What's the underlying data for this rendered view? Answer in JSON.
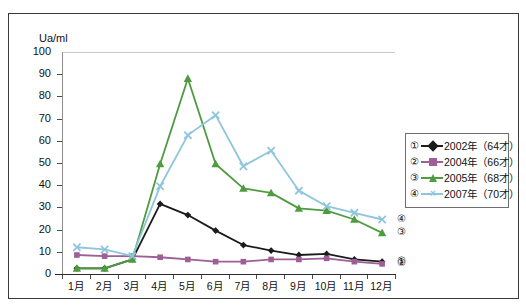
{
  "top_caption_ghost": "     ",
  "figure": {
    "y_axis_title": "Ua/ml"
  },
  "legend": {
    "rows": [
      {
        "index": "①",
        "label": "2002年（64才）",
        "color": "#1b1b1b",
        "marker": "diamond"
      },
      {
        "index": "②",
        "label": "2004年（66才）",
        "color": "#9d5f95",
        "marker": "square"
      },
      {
        "index": "③",
        "label": "2005年（68才）",
        "color": "#4f9b3f",
        "marker": "triangle"
      },
      {
        "index": "④",
        "label": "2007年（70才）",
        "color": "#8fc5dd",
        "marker": "cross"
      }
    ]
  },
  "callouts": [
    {
      "index": "④",
      "value": 25
    },
    {
      "index": "③",
      "value": 19
    },
    {
      "index": "①",
      "value": 6
    },
    {
      "index": "②",
      "value": 5
    }
  ],
  "chart_data": {
    "type": "line",
    "title": "",
    "xlabel": "",
    "ylabel": "Ua/ml",
    "ylim": [
      0,
      100
    ],
    "ytick_step": 10,
    "yticks": [
      0,
      10,
      20,
      30,
      40,
      50,
      60,
      70,
      80,
      90,
      100
    ],
    "grid": false,
    "legend_position": "right",
    "categories": [
      "1月",
      "2月",
      "3月",
      "4月",
      "5月",
      "6月",
      "7月",
      "8月",
      "9月",
      "10月",
      "11月",
      "12月"
    ],
    "series": [
      {
        "name": "2002年（64才）",
        "index": "①",
        "color": "#1b1b1b",
        "marker": "diamond",
        "values": [
          3,
          3,
          7,
          32,
          27,
          20,
          13.5,
          11,
          9,
          9.5,
          7,
          6
        ]
      },
      {
        "name": "2004年（66才）",
        "index": "②",
        "color": "#9d5f95",
        "marker": "square",
        "values": [
          9,
          8.5,
          8.5,
          8,
          7,
          6,
          6,
          7,
          7,
          7.5,
          6,
          5
        ]
      },
      {
        "name": "2005年（68才）",
        "index": "③",
        "color": "#4f9b3f",
        "marker": "triangle",
        "values": [
          3,
          3,
          7,
          50,
          88.5,
          50,
          39,
          37,
          30,
          29,
          25,
          19
        ]
      },
      {
        "name": "2007年（70才）",
        "index": "④",
        "color": "#8fc5dd",
        "marker": "cross",
        "values": [
          12.5,
          11.5,
          8.5,
          40,
          63,
          72,
          49,
          56,
          38,
          31,
          28,
          25
        ]
      }
    ]
  }
}
